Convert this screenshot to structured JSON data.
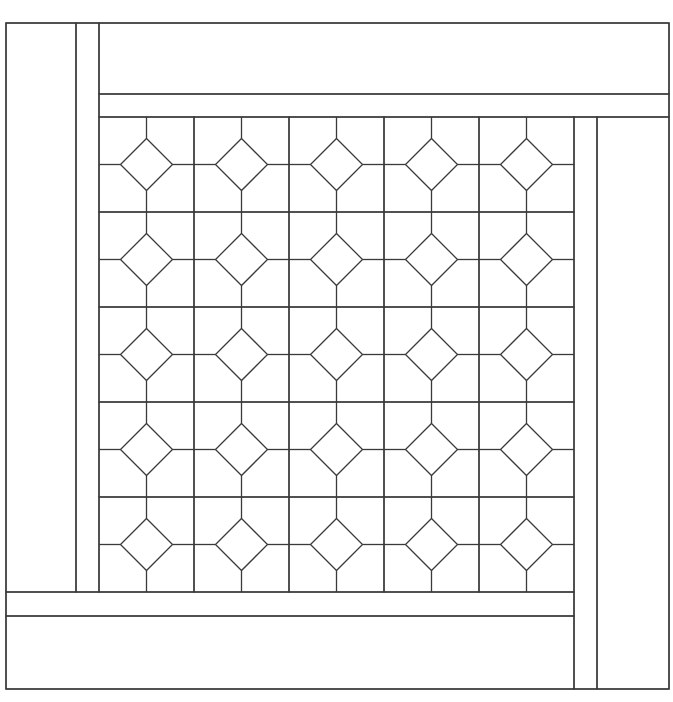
{
  "diagram": {
    "type": "quilt-pattern-line-drawing",
    "stroke_color": "#3a3a3a",
    "background_color": "#ffffff",
    "outer_frame": {
      "x1": 6,
      "y1": 23,
      "x2": 669,
      "y2": 689
    },
    "grid": {
      "rows": 5,
      "cols": 5,
      "x0": 99,
      "y0": 117,
      "block_size": 95,
      "diamond_half_diagonal": 26
    },
    "border_strips": {
      "left": [
        {
          "name": "left-outer-strip",
          "x1": 6,
          "y1": 23,
          "x2": 76,
          "y2": 592
        },
        {
          "name": "left-inner-strip",
          "x1": 76,
          "y1": 23,
          "x2": 99,
          "y2": 592
        }
      ],
      "top": [
        {
          "name": "top-outer-strip",
          "x1": 99,
          "y1": 23,
          "x2": 669,
          "y2": 94
        },
        {
          "name": "top-inner-strip",
          "x1": 99,
          "y1": 94,
          "x2": 669,
          "y2": 117
        }
      ],
      "right": [
        {
          "name": "right-inner-strip",
          "x1": 574,
          "y1": 117,
          "x2": 597,
          "y2": 689
        },
        {
          "name": "right-outer-strip",
          "x1": 597,
          "y1": 117,
          "x2": 669,
          "y2": 689
        }
      ],
      "bottom": [
        {
          "name": "bottom-inner-strip",
          "x1": 6,
          "y1": 592,
          "x2": 574,
          "y2": 616
        },
        {
          "name": "bottom-outer-strip",
          "x1": 6,
          "y1": 616,
          "x2": 574,
          "y2": 689
        }
      ]
    }
  }
}
